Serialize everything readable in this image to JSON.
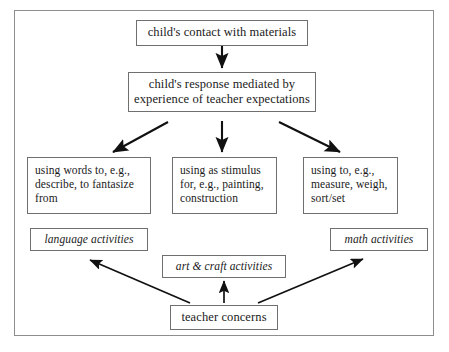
{
  "figure": {
    "caption": "",
    "frame_color": "#8e8e8e",
    "box_border_color": "#6f6f6f",
    "arrow_color": "#111111",
    "background": "#ffffff"
  },
  "nodes": {
    "contact": {
      "label": "child's contact with materials"
    },
    "response": {
      "label": "child's response mediated by experience of teacher expectations"
    },
    "words": {
      "label": "using words to, e.g., describe, to fantasize from"
    },
    "stimulus": {
      "label": "using as stimulus for, e.g., painting, construction"
    },
    "measure": {
      "label": "using to, e.g., measure, weigh, sort/set"
    },
    "language_activities": {
      "label": "language activities"
    },
    "art_craft_activities": {
      "label": "art & craft activities"
    },
    "math_activities": {
      "label": "math activities"
    },
    "teacher_concerns": {
      "label": "teacher concerns"
    }
  },
  "flow": {
    "edges": [
      {
        "from": "contact",
        "to": "response",
        "direction": "down"
      },
      {
        "from": "response",
        "to": "words",
        "direction": "down-left"
      },
      {
        "from": "response",
        "to": "stimulus",
        "direction": "down"
      },
      {
        "from": "response",
        "to": "measure",
        "direction": "down-right"
      },
      {
        "from": "teacher_concerns",
        "to": "language_activities",
        "direction": "up-left"
      },
      {
        "from": "teacher_concerns",
        "to": "art_craft_activities",
        "direction": "up"
      },
      {
        "from": "teacher_concerns",
        "to": "math_activities",
        "direction": "up-right"
      }
    ]
  }
}
